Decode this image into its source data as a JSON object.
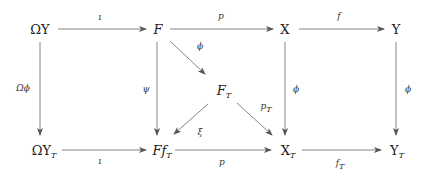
{
  "diagram": {
    "type": "commutative-diagram",
    "nodes": {
      "omega_y": {
        "base": "ΩY",
        "sub": ""
      },
      "f_top": {
        "base": "F",
        "sub": ""
      },
      "x_top": {
        "base": "X",
        "sub": ""
      },
      "y_top": {
        "base": "Y",
        "sub": ""
      },
      "f_t": {
        "base": "F",
        "sub": "T"
      },
      "omega_y_t": {
        "base": "ΩY",
        "sub": "T"
      },
      "ff_t": {
        "base": "Ff",
        "sub": "T"
      },
      "x_t": {
        "base": "X",
        "sub": "T"
      },
      "y_t": {
        "base": "Y",
        "sub": "T"
      }
    },
    "arrows": {
      "omegaY_to_F": "ι",
      "F_to_X": "p",
      "X_to_Y": "f",
      "F_to_FT": "ϕ",
      "omegaY_to_omegaYT": "Ωϕ",
      "F_to_FfT": "ψ",
      "X_to_XT": "ϕ",
      "Y_to_YT": "ϕ",
      "FT_to_FfT": "ξ",
      "FT_to_XT_base": "p",
      "FT_to_XT_sub": "T",
      "omegaYT_to_FfT": "ι",
      "FfT_to_XT": "p",
      "XT_to_YT_base": "f",
      "XT_to_YT_sub": "T"
    },
    "colors": {
      "line": "#555555",
      "text": "#222222"
    }
  }
}
